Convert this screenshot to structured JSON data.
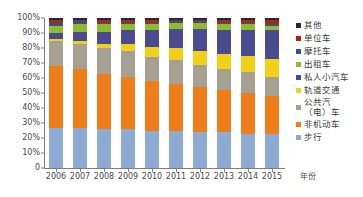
{
  "chart_data": {
    "type": "bar",
    "subtype": "stacked-100-percent",
    "title": "",
    "xlabel": "年份",
    "ylabel": "",
    "ylim": [
      0,
      100
    ],
    "grid": false,
    "legend_position": "right",
    "categories": [
      "2006",
      "2007",
      "2008",
      "2009",
      "2010",
      "2011",
      "2012",
      "2013",
      "2014",
      "2015"
    ],
    "y_ticks": [
      "0",
      "10%",
      "20%",
      "30%",
      "40%",
      "50%",
      "60%",
      "70%",
      "80%",
      "90%",
      "100%"
    ],
    "y_tick_values": [
      0,
      10,
      20,
      30,
      40,
      50,
      60,
      70,
      80,
      90,
      100
    ],
    "series": [
      {
        "name": "步行",
        "color": "#8eabd4",
        "values": [
          27,
          27,
          26,
          26,
          25,
          25,
          24,
          24,
          23,
          23
        ]
      },
      {
        "name": "非机动车",
        "color": "#ee7d1b",
        "values": [
          41,
          39,
          37,
          35,
          33,
          31,
          30,
          28,
          27,
          25
        ]
      },
      {
        "name": "公共汽（电）车",
        "color": "#a6a093",
        "values": [
          17,
          17,
          17,
          17,
          16,
          16,
          15,
          14,
          14,
          13
        ]
      },
      {
        "name": "轨道交通",
        "color": "#f2cf1b",
        "values": [
          1,
          2,
          3,
          5,
          7,
          8,
          9,
          10,
          11,
          12
        ]
      },
      {
        "name": "私人小汽车",
        "color": "#4a4b8f",
        "values": [
          4,
          6,
          8,
          9,
          11,
          13,
          15,
          16,
          17,
          19
        ]
      },
      {
        "name": "出租车",
        "color": "#8fbb32",
        "values": [
          5,
          5,
          5,
          4,
          4,
          4,
          4,
          4,
          4,
          3
        ]
      },
      {
        "name": "摩托车",
        "color": "#38517c",
        "values": [
          2,
          2,
          1,
          1,
          1,
          1,
          1,
          1,
          1,
          1
        ]
      },
      {
        "name": "单位车",
        "color": "#a62a16",
        "values": [
          2,
          1,
          2,
          2,
          2,
          1,
          1,
          2,
          2,
          3
        ]
      },
      {
        "name": "其他",
        "color": "#1f2b40",
        "values": [
          1,
          1,
          1,
          1,
          1,
          1,
          1,
          1,
          1,
          1
        ]
      }
    ]
  },
  "legend": {
    "items": [
      {
        "label": "其他",
        "color": "#1f2b40"
      },
      {
        "label": "单位车",
        "color": "#a62a16"
      },
      {
        "label": "摩托车",
        "color": "#38517c"
      },
      {
        "label": "出租车",
        "color": "#8fbb32"
      },
      {
        "label": "私人小汽车",
        "color": "#4a4b8f"
      },
      {
        "label": "轨道交通",
        "color": "#f2cf1b"
      },
      {
        "label": "公共汽\n（电）车",
        "color": "#a6a093"
      },
      {
        "label": "非机动车",
        "color": "#ee7d1b"
      },
      {
        "label": "步行",
        "color": "#8eabd4"
      }
    ]
  }
}
